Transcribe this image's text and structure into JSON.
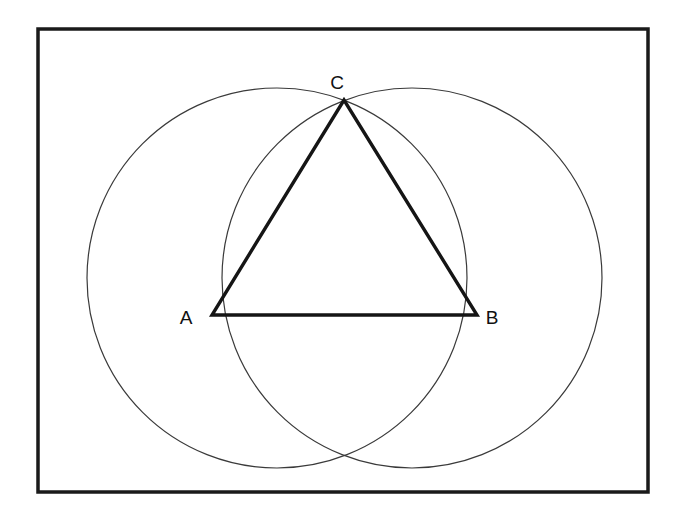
{
  "figure": {
    "background_color": "#ffffff",
    "frame": {
      "name": "border-rectangle",
      "x": 38,
      "y": 29,
      "width": 610,
      "height": 463,
      "stroke_color": "#1a1a1a",
      "stroke_width": 3.5
    },
    "circles": [
      {
        "name": "left-circle",
        "cx": 277,
        "cy": 278,
        "r": 190,
        "stroke_color": "#3a3a3a",
        "stroke_width": 1.2
      },
      {
        "name": "right-circle",
        "cx": 412,
        "cy": 278,
        "r": 190,
        "stroke_color": "#3a3a3a",
        "stroke_width": 1.2
      }
    ],
    "triangle": {
      "name": "equilateral-triangle-abc",
      "stroke_color": "#151515",
      "stroke_width": 3.4,
      "fill": "none",
      "points": "212,315 477,315 344,100"
    },
    "vertices": [
      {
        "id": "A",
        "label": "A",
        "px": 212,
        "py": 315,
        "label_x": 186,
        "label_y": 324
      },
      {
        "id": "B",
        "label": "B",
        "px": 477,
        "py": 315,
        "label_x": 492,
        "label_y": 324
      },
      {
        "id": "C",
        "label": "C",
        "px": 344,
        "py": 100,
        "label_x": 337,
        "label_y": 89
      }
    ],
    "intersections": [
      {
        "name": "top-intersection",
        "x": 344,
        "y": 100
      },
      {
        "name": "bottom-intersection",
        "x": 344,
        "y": 462
      }
    ]
  }
}
